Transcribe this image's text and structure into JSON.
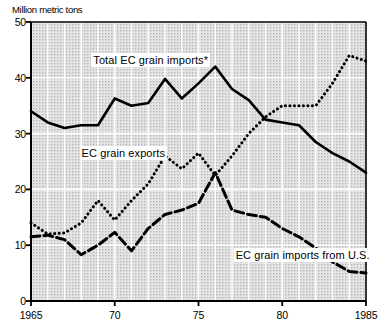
{
  "chart_data": {
    "type": "line",
    "title": "Million metric tons",
    "ylabel": "Million metric tons",
    "xlabel": "",
    "xlim": [
      1965,
      1985
    ],
    "ylim": [
      0,
      50
    ],
    "grid": true,
    "legend_position": "inline-annotations",
    "x": [
      1965,
      1966,
      1967,
      1968,
      1969,
      1970,
      1971,
      1972,
      1973,
      1974,
      1975,
      1976,
      1977,
      1978,
      1979,
      1980,
      1981,
      1982,
      1983,
      1984,
      1985
    ],
    "yticks": [
      "0",
      "10",
      "20",
      "30",
      "40",
      "50"
    ],
    "ytick_values": [
      0,
      10,
      20,
      30,
      40,
      50
    ],
    "xticks": [
      "1965",
      "70",
      "75",
      "80",
      "1985"
    ],
    "xtick_values": [
      1965,
      1970,
      1975,
      1980,
      1985
    ],
    "series": [
      {
        "name": "Total EC grain imports*",
        "style": "solid",
        "color": "#000000",
        "label_x": 1968.6,
        "label_y": 43.2,
        "values": [
          34,
          32,
          31,
          31.5,
          31.5,
          36.3,
          35,
          35.5,
          39.8,
          36.3,
          39,
          42,
          38,
          36,
          32.5,
          32,
          31.5,
          28.5,
          26.5,
          25,
          23
        ]
      },
      {
        "name": "EC grain exports",
        "style": "dotted",
        "color": "#000000",
        "label_x": 1967.9,
        "label_y": 26.6,
        "values": [
          14,
          12,
          12.2,
          14,
          18,
          14.5,
          18,
          21,
          26,
          23.7,
          26.5,
          22.5,
          26,
          30,
          33,
          35,
          35,
          35,
          39,
          44,
          43
        ]
      },
      {
        "name": "EC grain imports from U.S.",
        "style": "dashed",
        "color": "#000000",
        "label_x": 1977.1,
        "label_y": 8.2,
        "values": [
          11.5,
          11.8,
          11,
          8.3,
          10,
          12.3,
          9,
          13,
          15.5,
          16.3,
          17.5,
          23,
          16.3,
          15.5,
          15,
          13,
          11.5,
          9.5,
          7,
          5.3,
          5
        ]
      }
    ]
  }
}
